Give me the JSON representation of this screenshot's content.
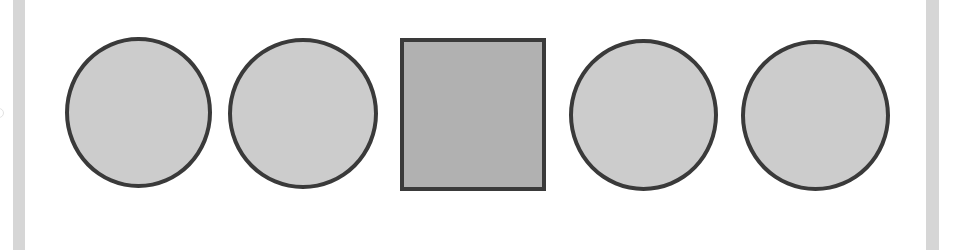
{
  "canvas": {
    "width": 956,
    "height": 250,
    "background": "#ffffff"
  },
  "colors": {
    "stroke": "#3a3a3a",
    "circle_fill": "#cccccc",
    "square_fill": "#b1b1b1",
    "side_bar": "#d6d6d6"
  },
  "side_bars": [
    {
      "x": 13,
      "width": 12
    },
    {
      "x": 926,
      "width": 13
    }
  ],
  "shapes": [
    {
      "type": "circle",
      "x": 65,
      "y": 37,
      "width": 147,
      "height": 151
    },
    {
      "type": "circle",
      "x": 228,
      "y": 38,
      "width": 150,
      "height": 151
    },
    {
      "type": "square",
      "x": 400,
      "y": 38,
      "width": 146,
      "height": 153
    },
    {
      "type": "circle",
      "x": 569,
      "y": 39,
      "width": 149,
      "height": 152
    },
    {
      "type": "circle",
      "x": 741,
      "y": 40,
      "width": 149,
      "height": 151
    }
  ],
  "stroke_width": 4
}
